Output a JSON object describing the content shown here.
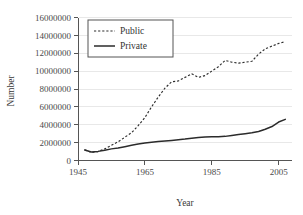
{
  "chart_data": {
    "type": "line",
    "title": "",
    "xlabel": "Year",
    "ylabel": "Number",
    "xlim": [
      1945,
      2009
    ],
    "ylim": [
      0,
      16000000
    ],
    "grid": true,
    "legend_position": "top-left",
    "xticks": [
      "1945",
      "1965",
      "1985",
      "2005"
    ],
    "xtick_values": [
      1945,
      1965,
      1985,
      2005
    ],
    "yticks": [
      "0",
      "2000000",
      "4000000",
      "6000000",
      "8000000",
      "10000000",
      "12000000",
      "14000000",
      "16000000"
    ],
    "ytick_values": [
      0,
      2000000,
      4000000,
      6000000,
      8000000,
      10000000,
      12000000,
      14000000,
      16000000
    ],
    "series": [
      {
        "name": "Public",
        "style": "dashed",
        "color": "#2d2d2d",
        "x": [
          1947,
          1949,
          1951,
          1953,
          1955,
          1957,
          1959,
          1961,
          1963,
          1965,
          1967,
          1969,
          1971,
          1973,
          1975,
          1977,
          1979,
          1981,
          1983,
          1985,
          1987,
          1989,
          1991,
          1993,
          1995,
          1997,
          1999,
          2001,
          2003,
          2005,
          2007
        ],
        "values": [
          1200000,
          900000,
          1000000,
          1300000,
          1700000,
          2100000,
          2600000,
          3100000,
          3900000,
          4800000,
          6000000,
          7100000,
          8100000,
          8800000,
          8900000,
          9300000,
          9700000,
          9300000,
          9500000,
          10000000,
          10500000,
          11200000,
          11000000,
          10900000,
          11000000,
          11100000,
          11900000,
          12500000,
          12800000,
          13100000,
          13300000
        ]
      },
      {
        "name": "Private",
        "style": "solid",
        "color": "#2b2b2b",
        "x": [
          1947,
          1949,
          1951,
          1953,
          1955,
          1957,
          1959,
          1961,
          1963,
          1965,
          1967,
          1969,
          1971,
          1973,
          1975,
          1977,
          1979,
          1981,
          1983,
          1985,
          1987,
          1989,
          1991,
          1993,
          1995,
          1997,
          1999,
          2001,
          2003,
          2005,
          2007
        ],
        "values": [
          1170000,
          950000,
          1020000,
          1150000,
          1300000,
          1400000,
          1550000,
          1700000,
          1850000,
          1950000,
          2050000,
          2120000,
          2180000,
          2250000,
          2320000,
          2400000,
          2500000,
          2580000,
          2630000,
          2650000,
          2650000,
          2700000,
          2800000,
          2900000,
          3000000,
          3100000,
          3250000,
          3500000,
          3800000,
          4300000,
          4600000
        ]
      }
    ]
  },
  "legend": {
    "items": [
      {
        "label": "Public",
        "style": "dashed"
      },
      {
        "label": "Private",
        "style": "solid"
      }
    ]
  },
  "axes": {
    "y_title": "Number",
    "x_title": "Year"
  }
}
